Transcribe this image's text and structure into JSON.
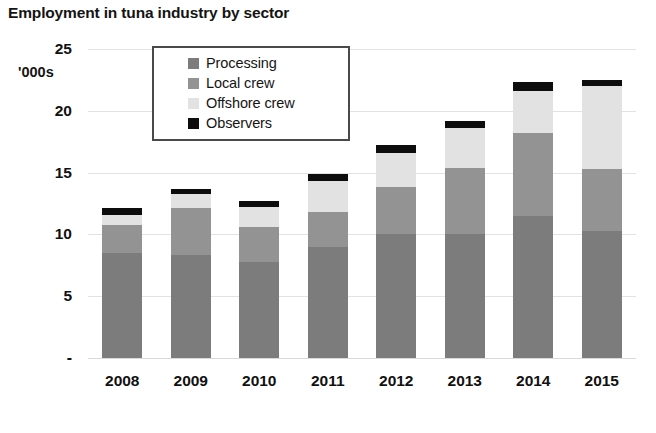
{
  "chart_data": {
    "type": "bar",
    "title": "Employment in tuna industry by sector",
    "subtitle": "",
    "xlabel": "",
    "ylabel": "'000s",
    "unit_label": "'000s",
    "stacked": true,
    "grid": true,
    "legend_position": "top-center-inside",
    "ylim": [
      0,
      25
    ],
    "yticks": [
      "-",
      "5",
      "10",
      "15",
      "20",
      "25"
    ],
    "ytick_values": [
      0,
      5,
      10,
      15,
      20,
      25
    ],
    "categories": [
      "2008",
      "2009",
      "2010",
      "2011",
      "2012",
      "2013",
      "2014",
      "2015"
    ],
    "series": [
      {
        "name": "Processing",
        "color": "#7c7c7c",
        "values": [
          8.5,
          8.3,
          7.8,
          9.0,
          10.0,
          10.0,
          11.5,
          10.3
        ]
      },
      {
        "name": "Local crew",
        "color": "#939393",
        "values": [
          2.3,
          3.8,
          2.8,
          2.8,
          3.8,
          5.4,
          6.7,
          5.0
        ]
      },
      {
        "name": "Offshore crew",
        "color": "#e2e2e2",
        "values": [
          0.8,
          1.2,
          1.6,
          2.5,
          2.8,
          3.2,
          3.4,
          6.7
        ]
      },
      {
        "name": "Observers",
        "color": "#0d0d0d",
        "values": [
          0.5,
          0.4,
          0.5,
          0.6,
          0.6,
          0.6,
          0.7,
          0.5
        ]
      }
    ],
    "totals": [
      12.1,
      13.7,
      12.7,
      14.9,
      17.2,
      19.2,
      22.3,
      22.5
    ]
  },
  "legend": {
    "items": [
      {
        "label": "Processing",
        "color": "#7c7c7c"
      },
      {
        "label": "Local crew",
        "color": "#939393"
      },
      {
        "label": "Offshore crew",
        "color": "#e2e2e2"
      },
      {
        "label": "Observers",
        "color": "#0d0d0d"
      }
    ]
  }
}
